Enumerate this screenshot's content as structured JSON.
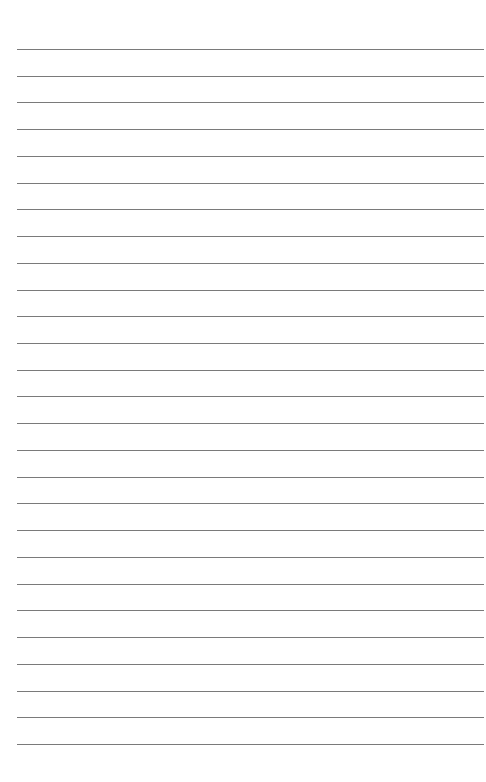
{
  "page": {
    "type": "lined-paper",
    "background": "#ffffff",
    "line_color": "#7a7a7a",
    "line_count": 27,
    "first_line_y": 49,
    "line_spacing": 26.73,
    "line_left": 17,
    "line_right": 484
  }
}
